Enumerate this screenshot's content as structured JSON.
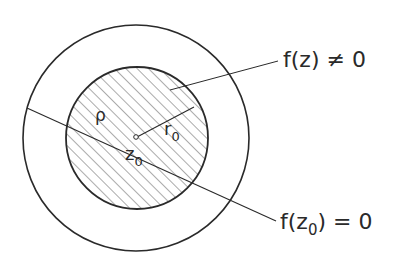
{
  "diagram": {
    "labels": {
      "nonzero": "f(z) ≠ 0",
      "zero_prefix": "f(z",
      "zero_sub": "0",
      "zero_suffix": ") = 0",
      "rho": "ρ",
      "r0_main": "r",
      "r0_sub": "0",
      "z0_main": "z",
      "z0_sub": "0"
    },
    "colors": {
      "stroke": "#2a2a2a",
      "background": "#ffffff"
    }
  }
}
